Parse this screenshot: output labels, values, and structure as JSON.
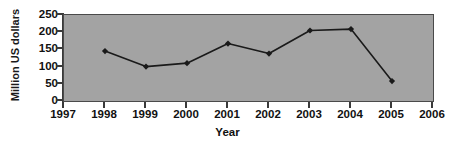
{
  "chart_data": {
    "type": "line",
    "title": "",
    "subtitle": "",
    "xlabel": "Year",
    "ylabel": "Million US dollars",
    "x": [
      1998,
      1999,
      2000,
      2001,
      2002,
      2003,
      2004,
      2005
    ],
    "categories": [
      "1998",
      "1999",
      "2000",
      "2001",
      "2002",
      "2003",
      "2004",
      "2005"
    ],
    "values": [
      145,
      100,
      110,
      167,
      138,
      205,
      209,
      58
    ],
    "series": [
      {
        "name": "Million US dollars",
        "values": [
          145,
          100,
          110,
          167,
          138,
          205,
          209,
          58
        ]
      }
    ],
    "xlim": [
      1997,
      2006
    ],
    "ylim": [
      0,
      250
    ],
    "x_ticks": [
      "1997",
      "1998",
      "1999",
      "2000",
      "2001",
      "2002",
      "2003",
      "2004",
      "2005",
      "2006"
    ],
    "x_tick_values": [
      1997,
      1998,
      1999,
      2000,
      2001,
      2002,
      2003,
      2004,
      2005,
      2006
    ],
    "y_ticks": [
      "0",
      "50",
      "100",
      "150",
      "200",
      "250"
    ],
    "y_tick_values": [
      0,
      50,
      100,
      150,
      200,
      250
    ],
    "grid": false,
    "legend": false,
    "legend_position": "none",
    "marker": "diamond",
    "colors": {
      "plot_background": "#a3a3a3",
      "page_background": "#ffffff",
      "line": "#1a1a1a",
      "marker": "#1a1a1a",
      "axis": "#3a3a3a",
      "text": "#111111"
    }
  },
  "axes": {
    "y_title": "Million US dollars",
    "x_title": "Year"
  }
}
